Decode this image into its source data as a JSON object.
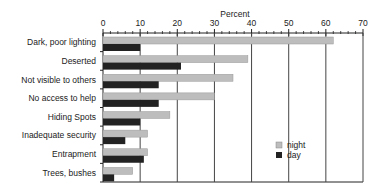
{
  "chart_data": {
    "type": "bar",
    "orientation": "horizontal",
    "title": "",
    "xlabel": "Percent",
    "ylabel": "",
    "xlim": [
      0,
      70
    ],
    "x_ticks": [
      0,
      10,
      20,
      30,
      40,
      50,
      60,
      70
    ],
    "minor_ticks_per_major": 5,
    "grid": "vertical major gridlines",
    "legend_position": "lower right inside plot",
    "categories": [
      "Dark, poor lighting",
      "Deserted",
      "Not visible to others",
      "No access to help",
      "Hiding Spots",
      "Inadequate security",
      "Entrapment",
      "Trees, bushes"
    ],
    "series": [
      {
        "name": "night",
        "color": "#bdbdbd",
        "values": [
          62,
          39,
          35,
          30,
          18,
          12,
          12,
          8
        ]
      },
      {
        "name": "day",
        "color": "#222222",
        "values": [
          10,
          21,
          15,
          15,
          10,
          6,
          11,
          3
        ]
      }
    ]
  },
  "legend": {
    "night": "night",
    "day": "day"
  },
  "axis": {
    "title": "Percent"
  }
}
